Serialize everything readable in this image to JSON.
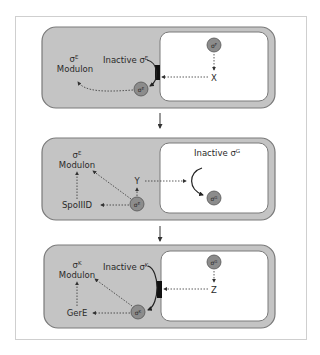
{
  "colors": {
    "mother_cell_fill": "#c4c4c4",
    "cell_border": "#7a7a7a",
    "forespore_fill": "#ffffff",
    "sigma_circle_fill": "#8c8c8c",
    "arrow": "#333333",
    "frame_border": "#cfcfcf",
    "membrane_block": "#111111"
  },
  "panels": [
    {
      "id": "panel-1",
      "mother_cell": {
        "modulon_sigma": "σ",
        "modulon_sigma_sup": "E",
        "modulon_label": "Modulon",
        "inactive_label": "Inactive σ",
        "inactive_sup": "E",
        "active_sigma": "σ",
        "active_sigma_sup": "E"
      },
      "forespore": {
        "sigma": "σ",
        "sigma_sup": "F",
        "signal": "X"
      }
    },
    {
      "id": "panel-2",
      "mother_cell": {
        "modulon_sigma": "σ",
        "modulon_sigma_sup": "E",
        "modulon_label": "Modulon",
        "regulator": "SpoIIID",
        "signal": "Y",
        "active_sigma": "σ",
        "active_sigma_sup": "E"
      },
      "forespore": {
        "inactive_label": "Inactive σ",
        "inactive_sup": "G",
        "sigma": "σ",
        "sigma_sup": "G"
      }
    },
    {
      "id": "panel-3",
      "mother_cell": {
        "modulon_sigma": "σ",
        "modulon_sigma_sup": "K",
        "modulon_label": "Modulon",
        "inactive_label": "Inactive σ",
        "inactive_sup": "K",
        "regulator": "GerE",
        "active_sigma": "σ",
        "active_sigma_sup": "K"
      },
      "forespore": {
        "sigma": "σ",
        "sigma_sup": "G",
        "signal": "Z"
      }
    }
  ]
}
